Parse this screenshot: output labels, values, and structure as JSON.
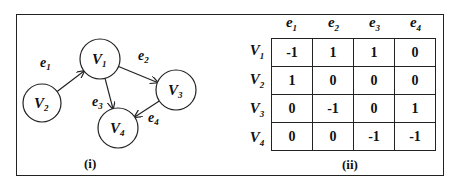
{
  "panels": {
    "left_label": "(i)",
    "right_label": "(ii)"
  },
  "graph": {
    "nodes": [
      {
        "id": "V1",
        "base": "V",
        "sub": "1",
        "cx": 100,
        "cy": 59,
        "r": 20
      },
      {
        "id": "V2",
        "base": "V",
        "sub": "2",
        "cx": 42,
        "cy": 103,
        "r": 19
      },
      {
        "id": "V3",
        "base": "V",
        "sub": "3",
        "cx": 176,
        "cy": 90,
        "r": 20
      },
      {
        "id": "V4",
        "base": "V",
        "sub": "4",
        "cx": 118,
        "cy": 128,
        "r": 20
      }
    ],
    "edges": [
      {
        "id": "e1",
        "base": "e",
        "sub": "1",
        "from": "V2",
        "to": "V1",
        "label_x": 40,
        "label_y": 67
      },
      {
        "id": "e2",
        "base": "e",
        "sub": "2",
        "from": "V1",
        "to": "V3",
        "label_x": 138,
        "label_y": 60
      },
      {
        "id": "e3",
        "base": "e",
        "sub": "3",
        "from": "V1",
        "to": "V4",
        "label_x": 92,
        "label_y": 106
      },
      {
        "id": "e4",
        "base": "e",
        "sub": "4",
        "from": "V3",
        "to": "V4",
        "label_x": 148,
        "label_y": 122
      }
    ]
  },
  "matrix": {
    "col_headers": [
      {
        "base": "e",
        "sub": "1"
      },
      {
        "base": "e",
        "sub": "2"
      },
      {
        "base": "e",
        "sub": "3"
      },
      {
        "base": "e",
        "sub": "4"
      }
    ],
    "row_headers": [
      {
        "base": "V",
        "sub": "1"
      },
      {
        "base": "V",
        "sub": "2"
      },
      {
        "base": "V",
        "sub": "3"
      },
      {
        "base": "V",
        "sub": "4"
      }
    ],
    "rows": [
      [
        "-1",
        "1",
        "1",
        "0"
      ],
      [
        "1",
        "0",
        "0",
        "0"
      ],
      [
        "0",
        "-1",
        "0",
        "1"
      ],
      [
        "0",
        "0",
        "-1",
        "-1"
      ]
    ]
  },
  "colors": {
    "stroke": "#222222",
    "text": "#111111",
    "background": "#ffffff"
  }
}
